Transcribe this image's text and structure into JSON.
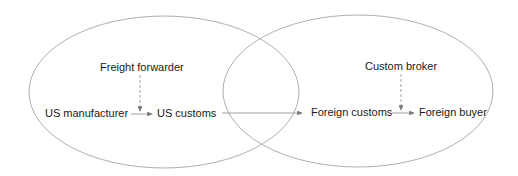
{
  "regions": [
    {
      "name": "us-region",
      "cx": 164,
      "cy": 92,
      "rx": 135,
      "ry": 76
    },
    {
      "name": "foreign-region",
      "cx": 358,
      "cy": 91,
      "rx": 135,
      "ry": 76
    }
  ],
  "nodes": {
    "freight_forwarder": "Freight forwarder",
    "us_manufacturer": "US manufacturer",
    "us_customs": "US customs",
    "foreign_customs": "Foreign customs",
    "custom_broker": "Custom broker",
    "foreign_buyer": "Foreign buyer"
  },
  "colors": {
    "ellipse": "#9a9a9a",
    "arrow": "#8a8a8a",
    "text": "#1a1a1a"
  }
}
